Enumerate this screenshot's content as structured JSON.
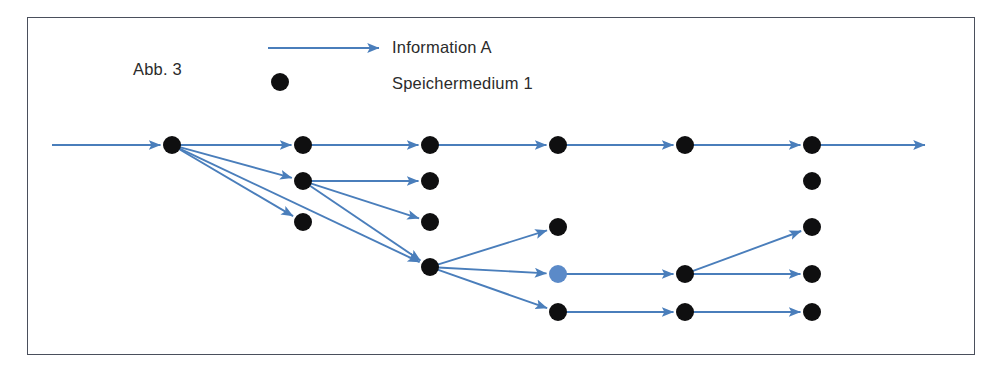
{
  "figure": {
    "label": "Abb. 3",
    "frame": {
      "x": 27,
      "y": 17,
      "width": 948,
      "height": 338,
      "border_color": "#4a4f5c"
    }
  },
  "legend": {
    "items": [
      {
        "symbol": "arrow",
        "label": "Information A",
        "color": "#4a7ebb"
      },
      {
        "symbol": "dot",
        "label": "Speichermedium 1",
        "color": "#0f0f10"
      }
    ],
    "arrow": {
      "x1": 268,
      "y1": 48,
      "x2": 379,
      "y2": 48
    },
    "dot": {
      "cx": 280,
      "cy": 82,
      "r": 9
    }
  },
  "colors": {
    "arrow": "#4a7ebb",
    "node_default": "#0f0f10",
    "node_highlight": "#5b8ac8",
    "frame": "#4a4f5c",
    "text": "#2b2b2b",
    "background": "#ffffff"
  },
  "chart_data": {
    "type": "diagram",
    "title": "Abb. 3",
    "node_radius": 9,
    "columns_x": [
      172,
      303,
      430,
      558,
      685,
      812
    ],
    "rows_y": [
      145,
      181,
      222,
      267,
      274,
      312
    ],
    "nodes": [
      {
        "id": "n1",
        "x": 172,
        "y": 145,
        "color": "#0f0f10"
      },
      {
        "id": "n2",
        "x": 303,
        "y": 145,
        "color": "#0f0f10"
      },
      {
        "id": "n3",
        "x": 430,
        "y": 145,
        "color": "#0f0f10"
      },
      {
        "id": "n4",
        "x": 558,
        "y": 145,
        "color": "#0f0f10"
      },
      {
        "id": "n5",
        "x": 685,
        "y": 145,
        "color": "#0f0f10"
      },
      {
        "id": "n6",
        "x": 812,
        "y": 145,
        "color": "#0f0f10"
      },
      {
        "id": "n7",
        "x": 303,
        "y": 181,
        "color": "#0f0f10"
      },
      {
        "id": "n8",
        "x": 430,
        "y": 181,
        "color": "#0f0f10"
      },
      {
        "id": "n9",
        "x": 812,
        "y": 181,
        "color": "#0f0f10"
      },
      {
        "id": "n10",
        "x": 303,
        "y": 222,
        "color": "#0f0f10"
      },
      {
        "id": "n11",
        "x": 430,
        "y": 222,
        "color": "#0f0f10"
      },
      {
        "id": "n12",
        "x": 558,
        "y": 227,
        "color": "#0f0f10"
      },
      {
        "id": "n13",
        "x": 812,
        "y": 227,
        "color": "#0f0f10"
      },
      {
        "id": "n14",
        "x": 430,
        "y": 267,
        "color": "#0f0f10"
      },
      {
        "id": "n15",
        "x": 558,
        "y": 274,
        "color": "#5b8ac8"
      },
      {
        "id": "n16",
        "x": 685,
        "y": 274,
        "color": "#0f0f10"
      },
      {
        "id": "n17",
        "x": 812,
        "y": 274,
        "color": "#0f0f10"
      },
      {
        "id": "n18",
        "x": 558,
        "y": 312,
        "color": "#0f0f10"
      },
      {
        "id": "n19",
        "x": 685,
        "y": 312,
        "color": "#0f0f10"
      },
      {
        "id": "n20",
        "x": 812,
        "y": 312,
        "color": "#0f0f10"
      }
    ],
    "edges": [
      {
        "x1": 52,
        "y1": 145,
        "x2": 172,
        "y2": 145
      },
      {
        "x1": 172,
        "y1": 145,
        "x2": 303,
        "y2": 145
      },
      {
        "x1": 303,
        "y1": 145,
        "x2": 430,
        "y2": 145
      },
      {
        "x1": 430,
        "y1": 145,
        "x2": 558,
        "y2": 145
      },
      {
        "x1": 558,
        "y1": 145,
        "x2": 685,
        "y2": 145
      },
      {
        "x1": 685,
        "y1": 145,
        "x2": 812,
        "y2": 145
      },
      {
        "x1": 812,
        "y1": 145,
        "x2": 925,
        "y2": 145
      },
      {
        "x1": 172,
        "y1": 145,
        "x2": 303,
        "y2": 181
      },
      {
        "x1": 172,
        "y1": 145,
        "x2": 303,
        "y2": 222
      },
      {
        "x1": 172,
        "y1": 145,
        "x2": 430,
        "y2": 267
      },
      {
        "x1": 303,
        "y1": 181,
        "x2": 430,
        "y2": 181
      },
      {
        "x1": 303,
        "y1": 181,
        "x2": 430,
        "y2": 222
      },
      {
        "x1": 303,
        "y1": 181,
        "x2": 430,
        "y2": 267
      },
      {
        "x1": 430,
        "y1": 267,
        "x2": 558,
        "y2": 227
      },
      {
        "x1": 430,
        "y1": 267,
        "x2": 558,
        "y2": 274
      },
      {
        "x1": 430,
        "y1": 267,
        "x2": 558,
        "y2": 312
      },
      {
        "x1": 558,
        "y1": 274,
        "x2": 685,
        "y2": 274
      },
      {
        "x1": 685,
        "y1": 274,
        "x2": 812,
        "y2": 227
      },
      {
        "x1": 685,
        "y1": 274,
        "x2": 812,
        "y2": 274
      },
      {
        "x1": 558,
        "y1": 312,
        "x2": 685,
        "y2": 312
      },
      {
        "x1": 685,
        "y1": 312,
        "x2": 812,
        "y2": 312
      }
    ]
  }
}
